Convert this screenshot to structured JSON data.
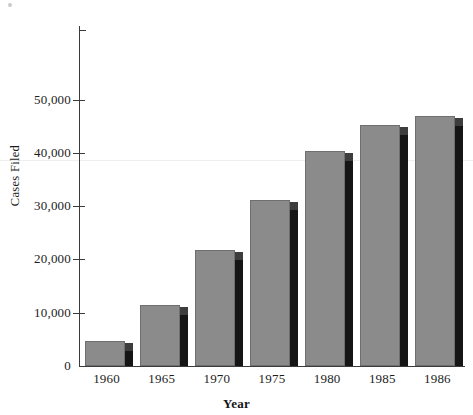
{
  "chart_data": {
    "type": "bar",
    "title": "",
    "xlabel": "Year",
    "ylabel": "Cases Filed",
    "categories": [
      "1960",
      "1965",
      "1970",
      "1975",
      "1980",
      "1985",
      "1986"
    ],
    "values": [
      4700,
      11500,
      21700,
      31200,
      40300,
      45200,
      46900
    ],
    "ylim": [
      0,
      55000
    ],
    "ytick_values": [
      0,
      10000,
      20000,
      30000,
      40000,
      50000
    ],
    "ytick_labels": [
      "0",
      "10,000",
      "20,000",
      "30,000",
      "40,000",
      "50,000"
    ],
    "grid": false,
    "legend": null,
    "style": {
      "bar_face_color": "#8b8b8b",
      "bar_edge_color": "#6f6f6f",
      "bar_shadow_color": "#151515",
      "axis_color": "#3a3a3a",
      "background": "#ffffff",
      "text_color": "#1c1c1c"
    }
  }
}
